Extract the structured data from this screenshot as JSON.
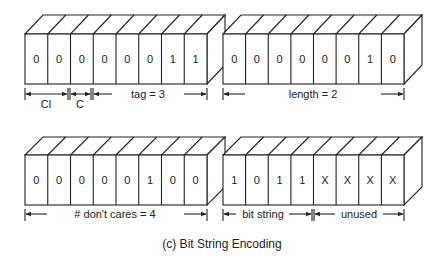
{
  "caption": "(c) Bit String Encoding",
  "blocks": [
    {
      "id": "tag-byte",
      "bits": [
        "0",
        "0",
        "0",
        "0",
        "0",
        "0",
        "1",
        "1"
      ],
      "labels": {
        "cl": "Cl",
        "c": "C",
        "tag": "tag = 3"
      }
    },
    {
      "id": "length-byte",
      "bits": [
        "0",
        "0",
        "0",
        "0",
        "0",
        "0",
        "1",
        "0"
      ],
      "labels": {
        "length": "length = 2"
      }
    },
    {
      "id": "dont-cares-byte",
      "bits": [
        "0",
        "0",
        "0",
        "0",
        "0",
        "1",
        "0",
        "0"
      ],
      "labels": {
        "dont_cares": "# don't cares = 4"
      }
    },
    {
      "id": "bit-string-byte",
      "bits": [
        "1",
        "0",
        "1",
        "1",
        "X",
        "X",
        "X",
        "X"
      ],
      "labels": {
        "bit_string": "bit string",
        "unused": "unused"
      }
    }
  ]
}
